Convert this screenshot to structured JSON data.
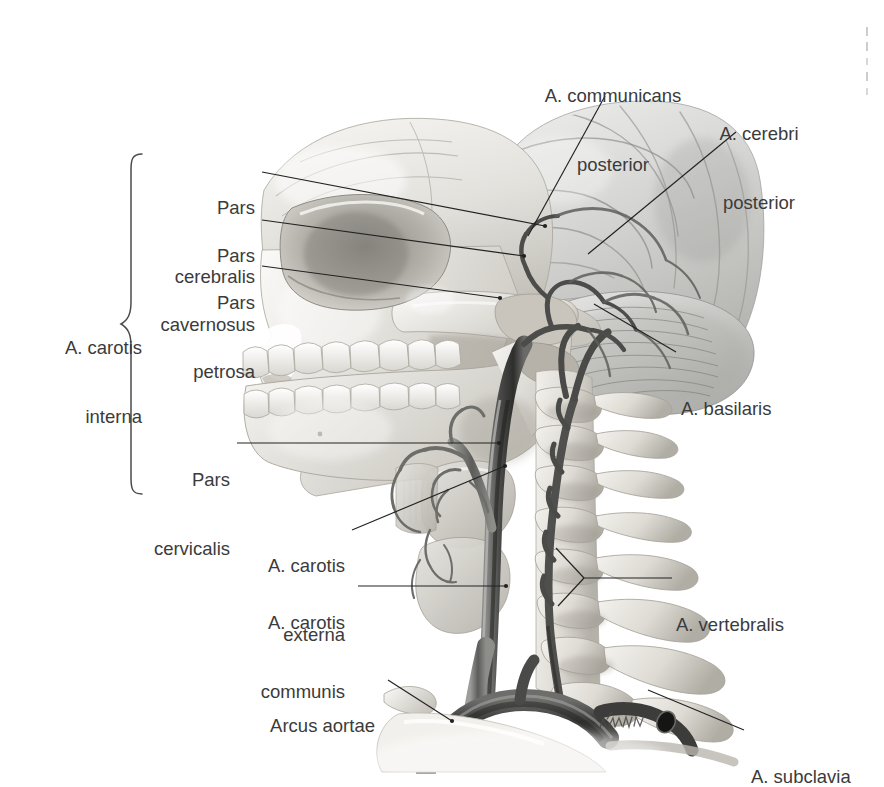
{
  "figure": {
    "kind": "anatomical-illustration",
    "background_color": "#ffffff",
    "label_color": "#3b3b3b",
    "leader_color": "#1f1f1f",
    "artwork_tone": "grayscale"
  },
  "brace": {
    "name": "A. carotis interna brace",
    "label_line1": "A. carotis",
    "label_line2": "interna"
  },
  "labels": {
    "pars_cerebralis": {
      "line1": "Pars",
      "line2": "cerebralis"
    },
    "pars_cavernosus": {
      "line1": "Pars",
      "line2": "cavernosus"
    },
    "pars_petrosa": {
      "line1": "Pars",
      "line2": "petrosa"
    },
    "pars_cervicalis": {
      "line1": "Pars",
      "line2": "cervicalis"
    },
    "a_carotis_externa": {
      "line1": "A. carotis",
      "line2": "externa"
    },
    "a_carotis_communis": {
      "line1": "A. carotis",
      "line2": "communis"
    },
    "arcus_aortae": {
      "line1": "Arcus aortae"
    },
    "a_communicans_posterior": {
      "line1": "A. communicans",
      "line2": "posterior"
    },
    "a_cerebri_posterior": {
      "line1": "A. cerebri",
      "line2": "posterior"
    },
    "a_basilaris": {
      "line1": "A. basilaris"
    },
    "a_vertebralis": {
      "line1": "A. vertebralis"
    },
    "a_subclavia": {
      "line1": "A. subclavia"
    }
  },
  "anatomy_parts": [
    "cerebrum",
    "cerebellum",
    "skull-cranium",
    "orbit",
    "zygomatic-arch",
    "maxilla-teeth",
    "mandible-teeth",
    "cervical-vertebrae",
    "internal-carotid-artery",
    "external-carotid-artery",
    "common-carotid-artery",
    "vertebral-artery",
    "basilar-artery",
    "aortic-arch",
    "subclavian-artery",
    "thyroid-gland",
    "larynx",
    "clavicle"
  ],
  "signature": {
    "text": "artist-signature-mark"
  }
}
